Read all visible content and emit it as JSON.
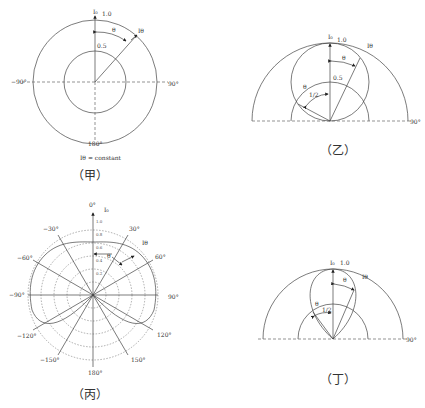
{
  "diagrams": {
    "jia": {
      "caption": "（甲）",
      "top_label": "I₀",
      "outer_value": "1.0",
      "inner_value": "0.5",
      "theta_label": "θ",
      "ray_label": "Iθ",
      "left_angle": "−90°",
      "right_angle": "90°",
      "bottom_angle": "180°",
      "note": "Iθ = constant"
    },
    "yi": {
      "caption": "（乙）",
      "top_label": "I₀",
      "outer_value": "1.0",
      "inner_value": "0.5",
      "theta_label": "θ",
      "theta_label2": "θ",
      "half_label": "1/2",
      "ray_label": "Iθ",
      "right_angle": "90°"
    },
    "bing": {
      "caption": "（丙）",
      "top_angle": "0°",
      "top_label": "I₀",
      "ray_label": "Iθ",
      "theta_label": "θ",
      "angles": {
        "m30": "−30°",
        "p30": "30°",
        "m60": "−60°",
        "p60": "60°",
        "m90": "−90°",
        "p90": "90°",
        "m120": "−120°",
        "p120": "120°",
        "m150": "−150°",
        "p150": "150°",
        "d180": "180°"
      },
      "scale_ticks": [
        "1.0",
        "0.8",
        "0.6",
        "0.4",
        "0.2"
      ]
    },
    "ding": {
      "caption": "（丁）",
      "top_label": "I₀",
      "outer_value": "1.0",
      "theta_label": "θ",
      "theta_label2": "θ",
      "half_label": "1/2",
      "ray_label": "Iθ",
      "right_angle": "90°"
    }
  }
}
